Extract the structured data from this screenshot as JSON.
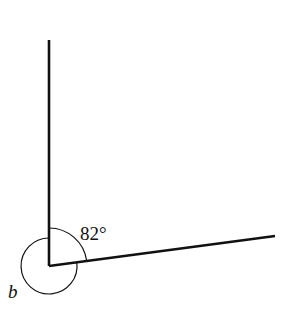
{
  "diagram": {
    "vertex": {
      "x": 49,
      "y": 266
    },
    "rays": [
      {
        "name": "vertical-ray",
        "x2": 49,
        "y2": 40
      },
      {
        "name": "slanted-ray",
        "x2": 275,
        "y2": 236
      }
    ],
    "angles": [
      {
        "name": "interior-angle",
        "label": "82°",
        "radius": 38
      },
      {
        "name": "reflex-angle-b",
        "label": "b",
        "radius": 28
      }
    ],
    "line_color": "#111111"
  }
}
